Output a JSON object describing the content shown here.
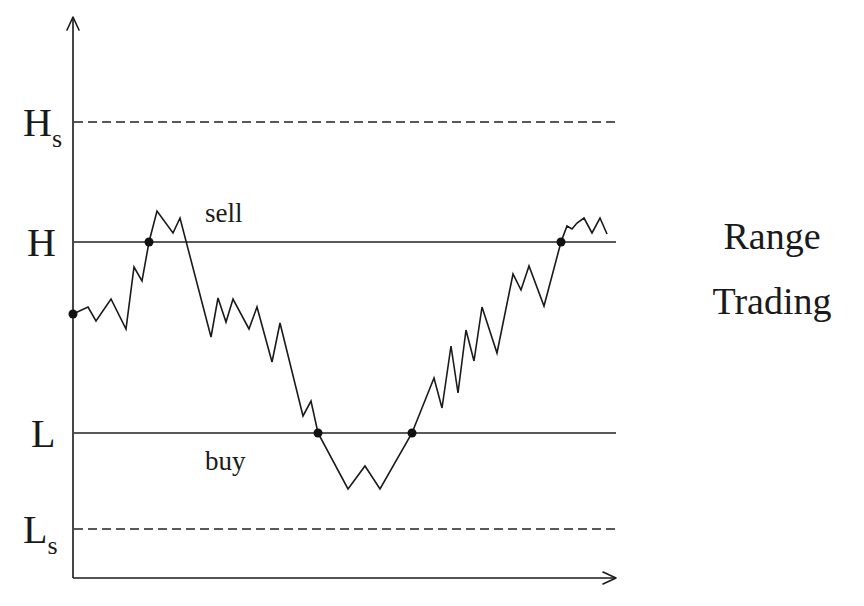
{
  "diagram": {
    "title_lines": [
      "Range",
      "Trading"
    ],
    "levels": [
      {
        "id": "Hs",
        "main": "H",
        "sub": "s",
        "style": "dashed",
        "y": 122
      },
      {
        "id": "H",
        "main": "H",
        "sub": "",
        "style": "solid",
        "y": 242
      },
      {
        "id": "L",
        "main": "L",
        "sub": "",
        "style": "solid",
        "y": 433
      },
      {
        "id": "Ls",
        "main": "L",
        "sub": "s",
        "style": "dashed",
        "y": 529
      }
    ],
    "annotations": {
      "sell": "sell",
      "buy": "buy"
    },
    "axes": {
      "origin": [
        73,
        578
      ],
      "y_axis_top": [
        73,
        17
      ],
      "x_axis_right": [
        616,
        578
      ]
    },
    "price_path": [
      [
        73,
        314
      ],
      [
        88,
        307
      ],
      [
        96,
        321
      ],
      [
        111,
        299
      ],
      [
        126,
        329
      ],
      [
        134,
        267
      ],
      [
        142,
        281
      ],
      [
        149,
        242
      ],
      [
        157,
        211
      ],
      [
        173,
        233
      ],
      [
        180,
        218
      ],
      [
        211,
        337
      ],
      [
        218,
        298
      ],
      [
        226,
        322
      ],
      [
        233,
        299
      ],
      [
        249,
        329
      ],
      [
        257,
        307
      ],
      [
        272,
        362
      ],
      [
        280,
        323
      ],
      [
        303,
        416
      ],
      [
        311,
        401
      ],
      [
        318,
        433
      ],
      [
        348,
        489
      ],
      [
        365,
        466
      ],
      [
        380,
        489
      ],
      [
        412,
        433
      ],
      [
        434,
        378
      ],
      [
        442,
        408
      ],
      [
        451,
        346
      ],
      [
        458,
        393
      ],
      [
        466,
        330
      ],
      [
        474,
        361
      ],
      [
        482,
        307
      ],
      [
        497,
        353
      ],
      [
        513,
        274
      ],
      [
        521,
        290
      ],
      [
        529,
        266
      ],
      [
        544,
        306
      ],
      [
        561,
        242
      ],
      [
        567,
        226
      ],
      [
        572,
        229
      ],
      [
        577,
        223
      ],
      [
        584,
        218
      ],
      [
        592,
        233
      ],
      [
        600,
        218
      ],
      [
        607,
        234
      ]
    ],
    "markers": [
      {
        "label": "start",
        "x": 73,
        "y": 314
      },
      {
        "label": "cross-H-up",
        "x": 149,
        "y": 242
      },
      {
        "label": "cross-L-down",
        "x": 318,
        "y": 433
      },
      {
        "label": "cross-L-up",
        "x": 412,
        "y": 433
      },
      {
        "label": "cross-H-up-2",
        "x": 561,
        "y": 242
      }
    ]
  }
}
